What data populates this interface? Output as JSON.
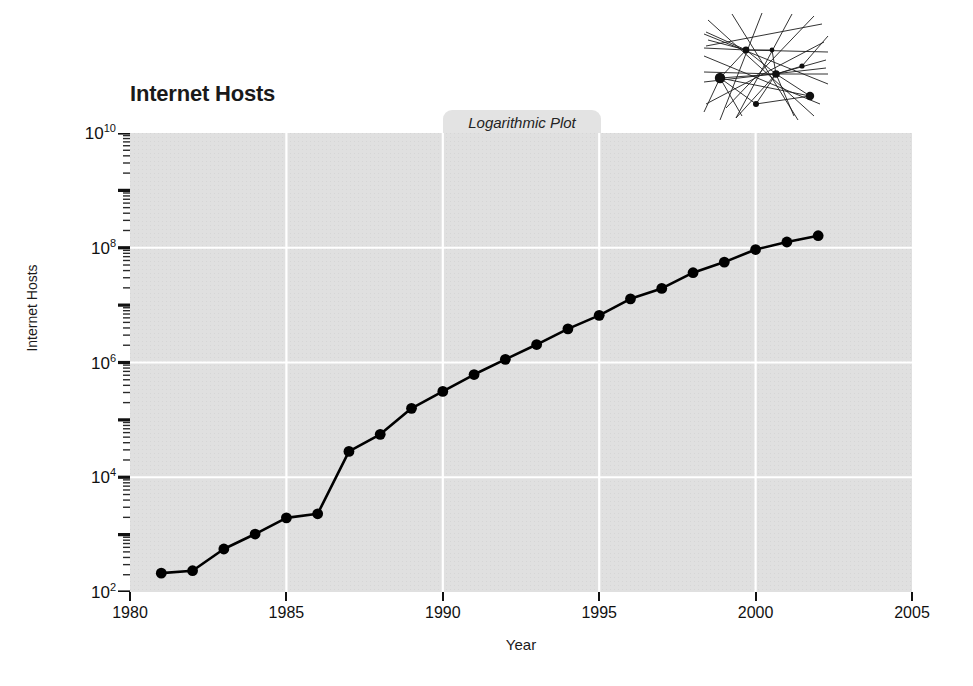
{
  "title": "Internet Hosts",
  "tab_label": "Logarithmic Plot",
  "network_graphic_name": "network-graph-thumbnail",
  "colors": {
    "plot_background": "#e0e0e0",
    "gridline": "#ffffff",
    "series_line": "#000000",
    "marker": "#000000",
    "tab_background": "#e3e3e3",
    "page_background": "#ffffff",
    "axis_text": "#111111"
  },
  "chart_data": {
    "type": "line",
    "title": "Internet Hosts",
    "subtitle": "Logarithmic Plot",
    "xlabel": "Year",
    "ylabel": "Internet Hosts",
    "yscale": "log",
    "xscale": "linear",
    "xlim": [
      1980,
      2005
    ],
    "ylim": [
      100,
      10000000000
    ],
    "xticks": [
      1980,
      1985,
      1990,
      1995,
      2000,
      2005
    ],
    "xtick_labels": [
      "1980",
      "1985",
      "1990",
      "1995",
      "2000",
      "2005"
    ],
    "yticks": [
      100,
      10000,
      1000000,
      100000000,
      10000000000
    ],
    "ytick_labels": [
      "10^2",
      "10^4",
      "10^6",
      "10^8",
      "10^10"
    ],
    "ytick_mantissa": "10",
    "ytick_exponents": [
      "2",
      "4",
      "6",
      "8",
      "10"
    ],
    "grid": true,
    "grid_color": "#ffffff",
    "legend": false,
    "marker": "filled-circle",
    "x": [
      1981,
      1982,
      1983,
      1984,
      1985,
      1986,
      1987,
      1988,
      1989,
      1990,
      1991,
      1992,
      1993,
      1994,
      1995,
      1996,
      1997,
      1998,
      1999,
      2000,
      2001,
      2002
    ],
    "values": [
      213,
      235,
      562,
      1024,
      1961,
      2308,
      28174,
      56000,
      159000,
      313000,
      617000,
      1136000,
      2056000,
      3864000,
      6642000,
      12881000,
      19540000,
      36739000,
      56218000,
      93047000,
      125888000,
      162128000
    ],
    "series": [
      {
        "name": "Internet Hosts",
        "values": [
          213,
          235,
          562,
          1024,
          1961,
          2308,
          28174,
          56000,
          159000,
          313000,
          617000,
          1136000,
          2056000,
          3864000,
          6642000,
          12881000,
          19540000,
          36739000,
          56218000,
          93047000,
          125888000,
          162128000
        ]
      }
    ]
  }
}
